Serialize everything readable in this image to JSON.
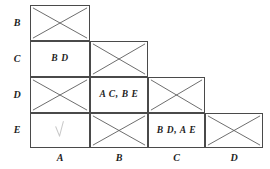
{
  "figure": {
    "kind": "triangular-pairing-matrix",
    "row_labels": [
      "B",
      "C",
      "D",
      "E"
    ],
    "col_labels": [
      "A",
      "B",
      "C",
      "D"
    ],
    "colors": {
      "grid_line": "#4a4a4a",
      "cross_line": "#555555",
      "check_mark": "#c9c9c9",
      "text": "#1d1d1d",
      "background": "#ffffff"
    },
    "cells": [
      {
        "row": "B",
        "col": "A",
        "state": "crossed",
        "text": "",
        "icon": "cross-out-icon"
      },
      {
        "row": "C",
        "col": "A",
        "state": "labeled",
        "text": "B D",
        "icon": ""
      },
      {
        "row": "C",
        "col": "B",
        "state": "crossed",
        "text": "",
        "icon": "cross-out-icon"
      },
      {
        "row": "D",
        "col": "A",
        "state": "crossed",
        "text": "",
        "icon": "cross-out-icon"
      },
      {
        "row": "D",
        "col": "B",
        "state": "labeled",
        "text": "A C, B E",
        "icon": ""
      },
      {
        "row": "D",
        "col": "C",
        "state": "crossed",
        "text": "",
        "icon": "cross-out-icon"
      },
      {
        "row": "E",
        "col": "A",
        "state": "checked",
        "text": "",
        "icon": "check-mark-icon"
      },
      {
        "row": "E",
        "col": "B",
        "state": "crossed",
        "text": "",
        "icon": "cross-out-icon"
      },
      {
        "row": "E",
        "col": "C",
        "state": "labeled",
        "text": "B D, A E",
        "icon": ""
      },
      {
        "row": "E",
        "col": "D",
        "state": "crossed",
        "text": "",
        "icon": "cross-out-icon"
      }
    ]
  }
}
